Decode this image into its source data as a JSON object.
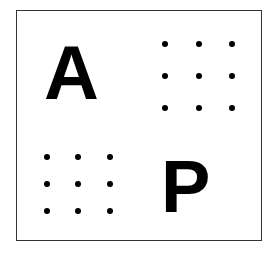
{
  "figure": {
    "frame_color": "#333333",
    "quadrants": [
      {
        "position": "top-left",
        "type": "letter",
        "text": "A"
      },
      {
        "position": "top-right",
        "type": "dot-grid",
        "rows": 3,
        "cols": 3
      },
      {
        "position": "bottom-left",
        "type": "dot-grid",
        "rows": 3,
        "cols": 3
      },
      {
        "position": "bottom-right",
        "type": "letter",
        "text": "P"
      }
    ],
    "letters": {
      "top_left": "A",
      "bottom_right": "P"
    },
    "dot_grids": {
      "top_right": {
        "xs": [
          165,
          199,
          232
        ],
        "ys": [
          44,
          76,
          108
        ]
      },
      "bottom_left": {
        "xs": [
          47,
          78,
          110
        ],
        "ys": [
          157,
          184,
          211
        ]
      }
    }
  }
}
